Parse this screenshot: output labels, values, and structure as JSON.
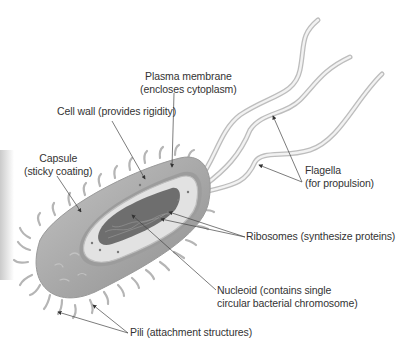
{
  "diagram": {
    "labels": {
      "plasma_membrane": {
        "line1": "Plasma membrane",
        "line2": "(encloses cytoplasm)"
      },
      "cell_wall": {
        "line1": "Cell wall (provides rigidity)"
      },
      "capsule": {
        "line1": "Capsule",
        "line2": "(sticky coating)"
      },
      "flagella": {
        "line1": "Flagella",
        "line2": "(for propulsion)"
      },
      "ribosomes": {
        "line1": "Ribosomes (synthesize proteins)"
      },
      "nucleoid": {
        "line1": "Nucleoid (contains single",
        "line2": "circular bacterial chromosome)"
      },
      "pili": {
        "line1": "Pili (attachment structures)"
      }
    },
    "colors": {
      "label_text": "#333333",
      "leader_line": "#444444",
      "capsule_fill": "#a8a8a8",
      "cytoplasm_fill": "#e2e2e2",
      "nucleoid_fill": "#6e6e6e"
    }
  }
}
